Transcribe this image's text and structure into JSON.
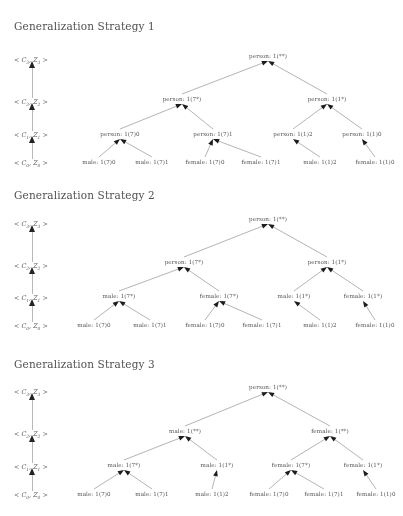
{
  "figure": {
    "axis_labels": [
      "< C3, Z3 >",
      "< C2, Z2 >",
      "< C1, Z1 >",
      "< C0, Z0 >"
    ],
    "arrow_icon": "up-arrow-icon"
  },
  "strategies": [
    {
      "id": "strategy-1",
      "heading": "Generalization Strategy 1",
      "nodes": [
        {
          "id": "s1-n0",
          "label": "person: 1(**)",
          "x": 268,
          "y": 57,
          "level": 3
        },
        {
          "id": "s1-n1",
          "label": "person: 1(7*)",
          "x": 182,
          "y": 100,
          "level": 2
        },
        {
          "id": "s1-n2",
          "label": "person: 1(1*)",
          "x": 327,
          "y": 100,
          "level": 2
        },
        {
          "id": "s1-n3",
          "label": "person: 1(7)0",
          "x": 120,
          "y": 135,
          "level": 1
        },
        {
          "id": "s1-n4",
          "label": "person: 1(7)1",
          "x": 213,
          "y": 135,
          "level": 1
        },
        {
          "id": "s1-n5",
          "label": "person: 1(1)2",
          "x": 293,
          "y": 135,
          "level": 1
        },
        {
          "id": "s1-n6",
          "label": "person: 1(1)0",
          "x": 362,
          "y": 135,
          "level": 1
        },
        {
          "id": "s1-n7",
          "label": "male: 1(7)0",
          "x": 99,
          "y": 163,
          "level": 0
        },
        {
          "id": "s1-n8",
          "label": "male: 1(7)1",
          "x": 152,
          "y": 163,
          "level": 0
        },
        {
          "id": "s1-n9",
          "label": "female: 1(7)0",
          "x": 205,
          "y": 163,
          "level": 0
        },
        {
          "id": "s1-n10",
          "label": "female: 1(7)1",
          "x": 261,
          "y": 163,
          "level": 0
        },
        {
          "id": "s1-n11",
          "label": "male: 1(1)2",
          "x": 320,
          "y": 163,
          "level": 0
        },
        {
          "id": "s1-n12",
          "label": "female: 1(1)0",
          "x": 375,
          "y": 163,
          "level": 0
        }
      ],
      "edges": [
        [
          "s1-n1",
          "s1-n0"
        ],
        [
          "s1-n2",
          "s1-n0"
        ],
        [
          "s1-n3",
          "s1-n1"
        ],
        [
          "s1-n4",
          "s1-n1"
        ],
        [
          "s1-n5",
          "s1-n2"
        ],
        [
          "s1-n6",
          "s1-n2"
        ],
        [
          "s1-n7",
          "s1-n3"
        ],
        [
          "s1-n8",
          "s1-n3"
        ],
        [
          "s1-n9",
          "s1-n4"
        ],
        [
          "s1-n10",
          "s1-n4"
        ],
        [
          "s1-n11",
          "s1-n5"
        ],
        [
          "s1-n12",
          "s1-n6"
        ]
      ]
    },
    {
      "id": "strategy-2",
      "heading": "Generalization Strategy 2",
      "nodes": [
        {
          "id": "s2-n0",
          "label": "person: 1(**)",
          "x": 268,
          "y": 42,
          "level": 3
        },
        {
          "id": "s2-n1",
          "label": "person: 1(7*)",
          "x": 184,
          "y": 85,
          "level": 2
        },
        {
          "id": "s2-n2",
          "label": "person: 1(1*)",
          "x": 327,
          "y": 85,
          "level": 2
        },
        {
          "id": "s2-n3",
          "label": "male: 1(7*)",
          "x": 119,
          "y": 119,
          "level": 1
        },
        {
          "id": "s2-n4",
          "label": "female: 1(7*)",
          "x": 219,
          "y": 119,
          "level": 1
        },
        {
          "id": "s2-n5",
          "label": "male: 1(1*)",
          "x": 294,
          "y": 119,
          "level": 1
        },
        {
          "id": "s2-n6",
          "label": "female: 1(1*)",
          "x": 363,
          "y": 119,
          "level": 1
        },
        {
          "id": "s2-n7",
          "label": "male: 1(7)0",
          "x": 94,
          "y": 148,
          "level": 0
        },
        {
          "id": "s2-n8",
          "label": "male: 1(7)1",
          "x": 150,
          "y": 148,
          "level": 0
        },
        {
          "id": "s2-n9",
          "label": "female: 1(7)0",
          "x": 205,
          "y": 148,
          "level": 0
        },
        {
          "id": "s2-n10",
          "label": "female: 1(7)1",
          "x": 262,
          "y": 148,
          "level": 0
        },
        {
          "id": "s2-n11",
          "label": "male: 1(1)2",
          "x": 320,
          "y": 148,
          "level": 0
        },
        {
          "id": "s2-n12",
          "label": "female: 1(1)0",
          "x": 375,
          "y": 148,
          "level": 0
        }
      ],
      "edges": [
        [
          "s2-n1",
          "s2-n0"
        ],
        [
          "s2-n2",
          "s2-n0"
        ],
        [
          "s2-n3",
          "s2-n1"
        ],
        [
          "s2-n4",
          "s2-n1"
        ],
        [
          "s2-n5",
          "s2-n2"
        ],
        [
          "s2-n6",
          "s2-n2"
        ],
        [
          "s2-n7",
          "s2-n3"
        ],
        [
          "s2-n8",
          "s2-n3"
        ],
        [
          "s2-n9",
          "s2-n4"
        ],
        [
          "s2-n10",
          "s2-n4"
        ],
        [
          "s2-n11",
          "s2-n5"
        ],
        [
          "s2-n12",
          "s2-n6"
        ]
      ]
    },
    {
      "id": "strategy-3",
      "heading": "Generalization Strategy 3",
      "nodes": [
        {
          "id": "s3-n0",
          "label": "person: 1(**)",
          "x": 268,
          "y": 38,
          "level": 3
        },
        {
          "id": "s3-n1",
          "label": "male: 1(**)",
          "x": 185,
          "y": 82,
          "level": 2
        },
        {
          "id": "s3-n2",
          "label": "female: 1(**)",
          "x": 330,
          "y": 82,
          "level": 2
        },
        {
          "id": "s3-n3",
          "label": "male: 1(7*)",
          "x": 124,
          "y": 116,
          "level": 1
        },
        {
          "id": "s3-n4",
          "label": "male: 1(1*)",
          "x": 217,
          "y": 116,
          "level": 1
        },
        {
          "id": "s3-n5",
          "label": "female: 1(7*)",
          "x": 291,
          "y": 116,
          "level": 1
        },
        {
          "id": "s3-n6",
          "label": "female: 1(1*)",
          "x": 363,
          "y": 116,
          "level": 1
        },
        {
          "id": "s3-n7",
          "label": "male: 1(7)0",
          "x": 94,
          "y": 145,
          "level": 0
        },
        {
          "id": "s3-n8",
          "label": "male: 1(7)1",
          "x": 152,
          "y": 145,
          "level": 0
        },
        {
          "id": "s3-n9",
          "label": "male: 1(1)2",
          "x": 212,
          "y": 145,
          "level": 0
        },
        {
          "id": "s3-n10",
          "label": "female: 1(7)0",
          "x": 269,
          "y": 145,
          "level": 0
        },
        {
          "id": "s3-n11",
          "label": "female: 1(7)1",
          "x": 324,
          "y": 145,
          "level": 0
        },
        {
          "id": "s3-n12",
          "label": "female: 1(1)0",
          "x": 376,
          "y": 145,
          "level": 0
        }
      ],
      "edges": [
        [
          "s3-n1",
          "s3-n0"
        ],
        [
          "s3-n2",
          "s3-n0"
        ],
        [
          "s3-n3",
          "s3-n1"
        ],
        [
          "s3-n4",
          "s3-n1"
        ],
        [
          "s3-n5",
          "s3-n2"
        ],
        [
          "s3-n6",
          "s3-n2"
        ],
        [
          "s3-n7",
          "s3-n3"
        ],
        [
          "s3-n8",
          "s3-n3"
        ],
        [
          "s3-n9",
          "s3-n4"
        ],
        [
          "s3-n10",
          "s3-n5"
        ],
        [
          "s3-n11",
          "s3-n5"
        ],
        [
          "s3-n12",
          "s3-n6"
        ]
      ]
    }
  ],
  "axis_rows": [
    {
      "strategy": "strategy-1",
      "ys": [
        60,
        102,
        135,
        163
      ]
    },
    {
      "strategy": "strategy-2",
      "ys": [
        46,
        88,
        120,
        148
      ]
    },
    {
      "strategy": "strategy-3",
      "ys": [
        42,
        84,
        117,
        145
      ]
    }
  ],
  "colors": {
    "text": "#4d4d4d",
    "heading": "#4a4a4a",
    "edge": "#9a9a9a",
    "arrowhead": "#141414",
    "background": "#ffffff"
  }
}
